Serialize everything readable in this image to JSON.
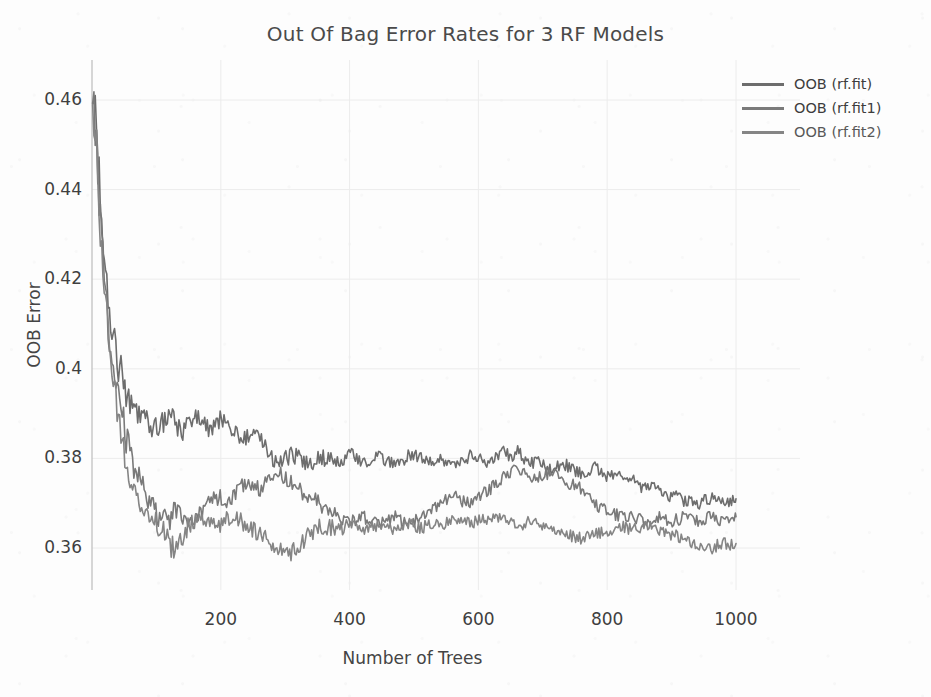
{
  "chart_data": {
    "type": "line",
    "title": "Out Of Bag Error Rates for 3 RF Models",
    "xlabel": "Number of Trees",
    "ylabel": "OOB Error",
    "xlim": [
      0,
      1000
    ],
    "ylim": [
      0.35,
      0.468
    ],
    "grid": true,
    "legend_position": "top-right",
    "xticks": [
      200,
      400,
      600,
      800,
      1000
    ],
    "xtick_labels": [
      "200",
      "400",
      "600",
      "800",
      "1000"
    ],
    "yticks": [
      0.46,
      0.44,
      0.42,
      0.4,
      0.38,
      0.36
    ],
    "ytick_labels": [
      "0.46",
      "0.44",
      "0.42",
      "0.4",
      "0.38",
      "0.36"
    ],
    "x": [
      1,
      11,
      21,
      31,
      41,
      51,
      61,
      71,
      81,
      91,
      101,
      111,
      121,
      131,
      141,
      151,
      161,
      171,
      181,
      191,
      201,
      211,
      221,
      231,
      241,
      251,
      261,
      271,
      281,
      291,
      301,
      311,
      321,
      331,
      341,
      351,
      361,
      371,
      381,
      391,
      401,
      411,
      421,
      431,
      441,
      451,
      461,
      471,
      481,
      491,
      501,
      511,
      521,
      531,
      541,
      551,
      561,
      571,
      581,
      591,
      601,
      611,
      621,
      631,
      641,
      651,
      661,
      671,
      681,
      691,
      701,
      711,
      721,
      731,
      741,
      751,
      761,
      771,
      781,
      791,
      801,
      811,
      821,
      831,
      841,
      851,
      861,
      871,
      881,
      891,
      901,
      911,
      921,
      931,
      941,
      951,
      961,
      971,
      981,
      991,
      1000
    ],
    "series": [
      {
        "name": "OOB (rf.fit)",
        "color": "#6d6d6d",
        "values": [
          0.465,
          0.4415,
          0.4205,
          0.4075,
          0.401,
          0.3965,
          0.393,
          0.3905,
          0.389,
          0.3875,
          0.387,
          0.3885,
          0.39,
          0.3875,
          0.386,
          0.388,
          0.3895,
          0.388,
          0.3865,
          0.3875,
          0.389,
          0.388,
          0.386,
          0.3845,
          0.385,
          0.3865,
          0.3845,
          0.382,
          0.38,
          0.379,
          0.38,
          0.381,
          0.38,
          0.3785,
          0.379,
          0.3805,
          0.38,
          0.3795,
          0.379,
          0.38,
          0.381,
          0.38,
          0.379,
          0.3795,
          0.3805,
          0.38,
          0.379,
          0.3785,
          0.3795,
          0.3805,
          0.381,
          0.38,
          0.379,
          0.3795,
          0.38,
          0.3795,
          0.3785,
          0.379,
          0.38,
          0.381,
          0.38,
          0.379,
          0.3795,
          0.3805,
          0.3815,
          0.3805,
          0.382,
          0.38,
          0.379,
          0.3795,
          0.3785,
          0.3775,
          0.378,
          0.379,
          0.378,
          0.377,
          0.3765,
          0.3775,
          0.378,
          0.377,
          0.376,
          0.3765,
          0.3755,
          0.3745,
          0.375,
          0.374,
          0.373,
          0.3735,
          0.3725,
          0.3715,
          0.372,
          0.371,
          0.3705,
          0.371,
          0.37,
          0.3705,
          0.371,
          0.3705,
          0.37,
          0.3705,
          0.371
        ]
      },
      {
        "name": "OOB (rf.fit1)",
        "color": "#7a7a7a",
        "values": [
          0.464,
          0.439,
          0.416,
          0.402,
          0.394,
          0.386,
          0.38,
          0.376,
          0.373,
          0.37,
          0.3675,
          0.366,
          0.3665,
          0.368,
          0.367,
          0.3655,
          0.3665,
          0.368,
          0.37,
          0.3715,
          0.371,
          0.37,
          0.372,
          0.3735,
          0.375,
          0.374,
          0.373,
          0.3745,
          0.376,
          0.377,
          0.3755,
          0.374,
          0.373,
          0.372,
          0.371,
          0.37,
          0.369,
          0.368,
          0.367,
          0.3665,
          0.366,
          0.3665,
          0.367,
          0.366,
          0.3655,
          0.366,
          0.3665,
          0.367,
          0.366,
          0.3655,
          0.366,
          0.367,
          0.368,
          0.369,
          0.37,
          0.371,
          0.372,
          0.371,
          0.37,
          0.3705,
          0.3715,
          0.3725,
          0.3735,
          0.3745,
          0.376,
          0.377,
          0.3775,
          0.377,
          0.376,
          0.3755,
          0.376,
          0.377,
          0.3765,
          0.3755,
          0.3745,
          0.374,
          0.373,
          0.372,
          0.37,
          0.369,
          0.368,
          0.3675,
          0.367,
          0.3665,
          0.367,
          0.3665,
          0.366,
          0.3665,
          0.367,
          0.3665,
          0.366,
          0.3665,
          0.367,
          0.3665,
          0.366,
          0.3665,
          0.367,
          0.3665,
          0.366,
          0.3665,
          0.367
        ]
      },
      {
        "name": "OOB (rf.fit2)",
        "color": "#858585",
        "values": [
          0.463,
          0.437,
          0.414,
          0.399,
          0.39,
          0.382,
          0.376,
          0.372,
          0.369,
          0.367,
          0.3655,
          0.3645,
          0.361,
          0.359,
          0.362,
          0.365,
          0.3665,
          0.367,
          0.366,
          0.365,
          0.3655,
          0.3665,
          0.367,
          0.366,
          0.365,
          0.364,
          0.363,
          0.362,
          0.361,
          0.36,
          0.3585,
          0.359,
          0.3605,
          0.362,
          0.3635,
          0.3645,
          0.365,
          0.3645,
          0.364,
          0.3645,
          0.365,
          0.3645,
          0.364,
          0.3645,
          0.365,
          0.3645,
          0.364,
          0.3645,
          0.365,
          0.3655,
          0.365,
          0.3645,
          0.365,
          0.3655,
          0.365,
          0.3655,
          0.366,
          0.3665,
          0.366,
          0.3655,
          0.366,
          0.3665,
          0.367,
          0.3665,
          0.366,
          0.3655,
          0.365,
          0.3655,
          0.366,
          0.3655,
          0.365,
          0.3645,
          0.364,
          0.3635,
          0.363,
          0.3625,
          0.362,
          0.3625,
          0.363,
          0.3635,
          0.364,
          0.3645,
          0.365,
          0.3645,
          0.364,
          0.3645,
          0.365,
          0.3645,
          0.364,
          0.3635,
          0.363,
          0.3625,
          0.362,
          0.3615,
          0.361,
          0.3605,
          0.36,
          0.3605,
          0.361,
          0.3605,
          0.361
        ]
      }
    ]
  },
  "legend": {
    "items": [
      {
        "label": "OOB (rf.fit)"
      },
      {
        "label": "OOB (rf.fit1)"
      },
      {
        "label": "OOB (rf.fit2)"
      }
    ]
  },
  "colors": {
    "background": "#fdfdfd",
    "text": "#3f3f3f",
    "title": "#4a4a4a",
    "grid": "#ececec",
    "axis": "#bdbdbd"
  }
}
